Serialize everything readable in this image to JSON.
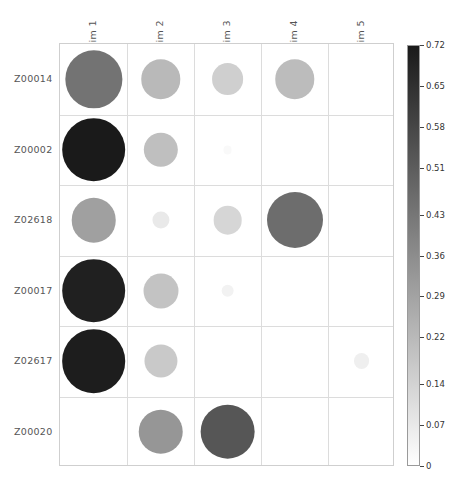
{
  "chart_data": {
    "type": "heatmap",
    "title": "",
    "xlabel": "",
    "ylabel": "",
    "grid": true,
    "legend_position": "right",
    "categories_x": [
      "Dim 1",
      "Dim 2",
      "Dim 3",
      "Dim 4",
      "Dim 5"
    ],
    "categories_y": [
      "Z00014",
      "Z00002",
      "Z02618",
      "Z00017",
      "Z02617",
      "Z00020"
    ],
    "colorbar": {
      "min": 0,
      "max": 0.72,
      "ticks": [
        "0.72",
        "0.65",
        "0.58",
        "0.51",
        "0.43",
        "0.36",
        "0.29",
        "0.22",
        "0.14",
        "0.07",
        "0"
      ],
      "tick_values": [
        0.72,
        0.65,
        0.58,
        0.51,
        0.43,
        0.36,
        0.29,
        0.22,
        0.14,
        0.07,
        0
      ],
      "color_low": "#ffffff",
      "color_high": "#1a1a1a"
    },
    "cells": [
      {
        "row": "Z00014",
        "col": "Dim 1",
        "value": 0.44,
        "size": 0.9
      },
      {
        "row": "Z00014",
        "col": "Dim 2",
        "value": 0.22,
        "size": 0.62
      },
      {
        "row": "Z00014",
        "col": "Dim 3",
        "value": 0.15,
        "size": 0.5
      },
      {
        "row": "Z00014",
        "col": "Dim 4",
        "value": 0.21,
        "size": 0.62
      },
      {
        "row": "Z00014",
        "col": "Dim 5",
        "value": 0.0,
        "size": 0.0
      },
      {
        "row": "Z00002",
        "col": "Dim 1",
        "value": 0.72,
        "size": 1.0
      },
      {
        "row": "Z00002",
        "col": "Dim 2",
        "value": 0.2,
        "size": 0.54
      },
      {
        "row": "Z00002",
        "col": "Dim 3",
        "value": 0.02,
        "size": 0.14
      },
      {
        "row": "Z00002",
        "col": "Dim 4",
        "value": 0.0,
        "size": 0.0
      },
      {
        "row": "Z00002",
        "col": "Dim 5",
        "value": 0.0,
        "size": 0.0
      },
      {
        "row": "Z02618",
        "col": "Dim 1",
        "value": 0.3,
        "size": 0.7
      },
      {
        "row": "Z02618",
        "col": "Dim 2",
        "value": 0.07,
        "size": 0.27
      },
      {
        "row": "Z02618",
        "col": "Dim 3",
        "value": 0.13,
        "size": 0.45
      },
      {
        "row": "Z02618",
        "col": "Dim 4",
        "value": 0.46,
        "size": 0.88
      },
      {
        "row": "Z02618",
        "col": "Dim 5",
        "value": 0.0,
        "size": 0.0
      },
      {
        "row": "Z00017",
        "col": "Dim 1",
        "value": 0.7,
        "size": 1.0
      },
      {
        "row": "Z00017",
        "col": "Dim 2",
        "value": 0.19,
        "size": 0.55
      },
      {
        "row": "Z00017",
        "col": "Dim 3",
        "value": 0.04,
        "size": 0.2
      },
      {
        "row": "Z00017",
        "col": "Dim 4",
        "value": 0.0,
        "size": 0.0
      },
      {
        "row": "Z00017",
        "col": "Dim 5",
        "value": 0.0,
        "size": 0.0
      },
      {
        "row": "Z02617",
        "col": "Dim 1",
        "value": 0.71,
        "size": 1.0
      },
      {
        "row": "Z02617",
        "col": "Dim 2",
        "value": 0.17,
        "size": 0.52
      },
      {
        "row": "Z02617",
        "col": "Dim 3",
        "value": 0.0,
        "size": 0.0
      },
      {
        "row": "Z02617",
        "col": "Dim 4",
        "value": 0.0,
        "size": 0.0
      },
      {
        "row": "Z02617",
        "col": "Dim 5",
        "value": 0.05,
        "size": 0.25
      },
      {
        "row": "Z00020",
        "col": "Dim 1",
        "value": 0.0,
        "size": 0.0
      },
      {
        "row": "Z00020",
        "col": "Dim 2",
        "value": 0.33,
        "size": 0.7
      },
      {
        "row": "Z00020",
        "col": "Dim 3",
        "value": 0.53,
        "size": 0.86
      },
      {
        "row": "Z00020",
        "col": "Dim 4",
        "value": 0.0,
        "size": 0.0
      },
      {
        "row": "Z00020",
        "col": "Dim 5",
        "value": 0.0,
        "size": 0.0
      }
    ]
  }
}
